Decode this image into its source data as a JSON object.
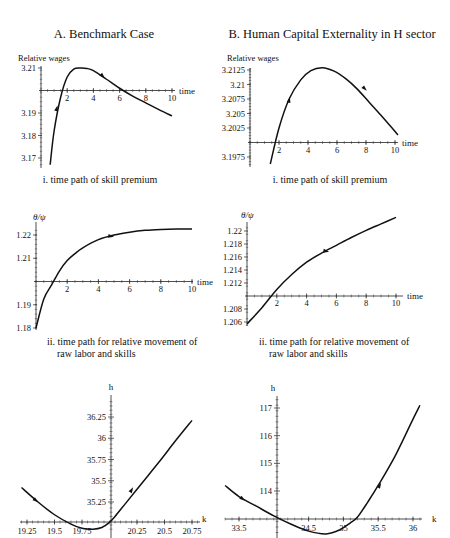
{
  "titles": {
    "panel_a": "A. Benchmark Case",
    "panel_b": "B. Human Capital Externality in H sector"
  },
  "captions": {
    "a_i": "i. time path of skill premium",
    "b_i": "i. time path of skill premium",
    "a_ii_line1": "ii. time path for relative movement of",
    "a_ii_line2": "raw labor and skills",
    "b_ii_line1": "ii. time path for relative movement of",
    "b_ii_line2": "raw labor and skills"
  },
  "chart_data": [
    {
      "id": "a_i",
      "type": "line",
      "title": "A. Benchmark Case — i. time path of skill premium",
      "xlabel": "time",
      "ylabel": "Relative wages",
      "x_ticks": [
        "2",
        "4",
        "6",
        "8",
        "10"
      ],
      "y_ticks": [
        "3.21",
        "3.19",
        "3.18",
        "3.17"
      ],
      "axis_cross_y": 3.2,
      "xlim": [
        0,
        10
      ],
      "ylim": [
        3.167,
        3.211
      ],
      "x": [
        0.7,
        1.0,
        1.5,
        2.0,
        2.5,
        3.0,
        3.5,
        4.0,
        5.0,
        6.0,
        7.0,
        8.0,
        9.0,
        10.0
      ],
      "values": [
        3.167,
        3.182,
        3.197,
        3.206,
        3.2095,
        3.21,
        3.2098,
        3.2088,
        3.205,
        3.201,
        3.1975,
        3.1945,
        3.1915,
        3.1887
      ],
      "arrows": [
        {
          "x": 1.2,
          "y": 3.192,
          "dir": "up"
        },
        {
          "x": 4.7,
          "y": 3.2065,
          "dir": "down"
        }
      ]
    },
    {
      "id": "b_i",
      "type": "line",
      "title": "B. Human Capital Externality in H sector — i. time path of skill premium",
      "xlabel": "time",
      "ylabel": "Relative wages",
      "x_ticks": [
        "2",
        "4",
        "6",
        "8",
        "10"
      ],
      "y_ticks": [
        "3.2125",
        "3.21",
        "3.2075",
        "3.205",
        "3.2025",
        "3.1975"
      ],
      "axis_cross_y": 3.2,
      "xlim": [
        0,
        10
      ],
      "ylim": [
        3.1962,
        3.2128
      ],
      "x": [
        1.4,
        2.0,
        2.7,
        3.5,
        4.2,
        5.0,
        5.8,
        6.6,
        7.4,
        8.2,
        9.0,
        9.8,
        10.2
      ],
      "values": [
        3.1963,
        3.2025,
        3.2075,
        3.2108,
        3.2124,
        3.2129,
        3.2123,
        3.211,
        3.2092,
        3.207,
        3.2048,
        3.2025,
        3.2013
      ],
      "arrows": [
        {
          "x": 2.7,
          "y": 3.2073,
          "dir": "up"
        },
        {
          "x": 7.9,
          "y": 3.2093,
          "dir": "down"
        }
      ]
    },
    {
      "id": "a_ii",
      "type": "line",
      "title": "A. Benchmark Case — ii. time path for relative movement of raw labor and skills",
      "xlabel": "time",
      "ylabel": "θ/ψ",
      "x_ticks": [
        "2",
        "4",
        "6",
        "8",
        "10"
      ],
      "y_ticks": [
        "1.22",
        "1.21",
        "1.19",
        "1.18"
      ],
      "axis_cross_y": 1.2,
      "xlim": [
        0,
        10
      ],
      "ylim": [
        1.18,
        1.223
      ],
      "x": [
        0,
        0.5,
        1.0,
        1.5,
        2.0,
        2.5,
        3.0,
        4.0,
        5.0,
        6.0,
        7.0,
        8.0,
        9.0,
        10.0
      ],
      "values": [
        1.18,
        1.1925,
        1.1985,
        1.2045,
        1.209,
        1.212,
        1.2145,
        1.218,
        1.22,
        1.2212,
        1.222,
        1.2224,
        1.2226,
        1.2226
      ],
      "arrows": [
        {
          "x": 4.8,
          "y": 1.2195,
          "dir": "right"
        }
      ]
    },
    {
      "id": "b_ii",
      "type": "line",
      "title": "B. Human Capital Externality in H sector — ii. time path for relative movement of raw labor and skills",
      "xlabel": "time",
      "ylabel": "θ/ψ",
      "x_ticks": [
        "2",
        "4",
        "6",
        "8",
        "10"
      ],
      "y_ticks": [
        "1.22",
        "1.218",
        "1.216",
        "1.214",
        "1.212",
        "1.208",
        "1.206"
      ],
      "axis_cross_y": 1.21,
      "xlim": [
        0,
        10
      ],
      "ylim": [
        1.2055,
        1.2222
      ],
      "x": [
        0,
        1.0,
        2.0,
        3.0,
        4.0,
        5.0,
        6.0,
        7.0,
        8.0,
        9.0,
        10.0
      ],
      "values": [
        1.2057,
        1.2082,
        1.211,
        1.2133,
        1.2152,
        1.2166,
        1.2178,
        1.219,
        1.2201,
        1.2211,
        1.2221
      ],
      "arrows": [
        {
          "x": 5.3,
          "y": 1.2169,
          "dir": "right"
        }
      ]
    },
    {
      "id": "a_iii",
      "type": "line",
      "title": "A. Benchmark Case — phase path",
      "xlabel": "k",
      "ylabel": "h",
      "x_ticks": [
        "19.25",
        "19.5",
        "19.75",
        "20.25",
        "20.5",
        "20.75"
      ],
      "y_ticks": [
        "36.25",
        "36",
        "35.75",
        "35.5",
        "35.25"
      ],
      "axis_cross_x": 20.0,
      "axis_cross_y": 35.0,
      "xlim": [
        19.2,
        20.8
      ],
      "ylim": [
        34.93,
        36.43
      ],
      "x": [
        19.2,
        19.35,
        19.5,
        19.65,
        19.75,
        19.85,
        19.93,
        20.0,
        20.05,
        20.15,
        20.3,
        20.45,
        20.6,
        20.75
      ],
      "values": [
        35.42,
        35.25,
        35.1,
        34.99,
        34.94,
        34.93,
        34.95,
        35.01,
        35.08,
        35.24,
        35.48,
        35.72,
        35.97,
        36.21
      ],
      "arrows": [
        {
          "x": 19.33,
          "y": 35.27,
          "dir": "down-right"
        },
        {
          "x": 20.2,
          "y": 35.39,
          "dir": "up-right"
        }
      ]
    },
    {
      "id": "b_iii",
      "type": "line",
      "title": "B. Human Capital Externality in H sector — phase path",
      "xlabel": "k",
      "ylabel": "h",
      "x_ticks": [
        "33.5",
        "34.5",
        "35",
        "35.5",
        "36"
      ],
      "y_ticks": [
        "117",
        "116",
        "115",
        "114"
      ],
      "axis_cross_x": 34.0,
      "axis_cross_y": 113.0,
      "xlim": [
        33.3,
        36.1
      ],
      "ylim": [
        112.3,
        117.3
      ],
      "x": [
        33.3,
        33.5,
        33.75,
        34.0,
        34.25,
        34.5,
        34.75,
        34.95,
        35.1,
        35.2,
        35.35,
        35.5,
        35.75,
        36.0,
        36.1
      ],
      "values": [
        114.2,
        113.8,
        113.45,
        113.1,
        112.8,
        112.55,
        112.45,
        112.6,
        112.85,
        113.05,
        113.6,
        114.2,
        115.3,
        116.6,
        117.1
      ],
      "arrows": [
        {
          "x": 33.55,
          "y": 113.72,
          "dir": "down-right"
        },
        {
          "x": 35.52,
          "y": 114.2,
          "dir": "up-right"
        }
      ]
    }
  ]
}
